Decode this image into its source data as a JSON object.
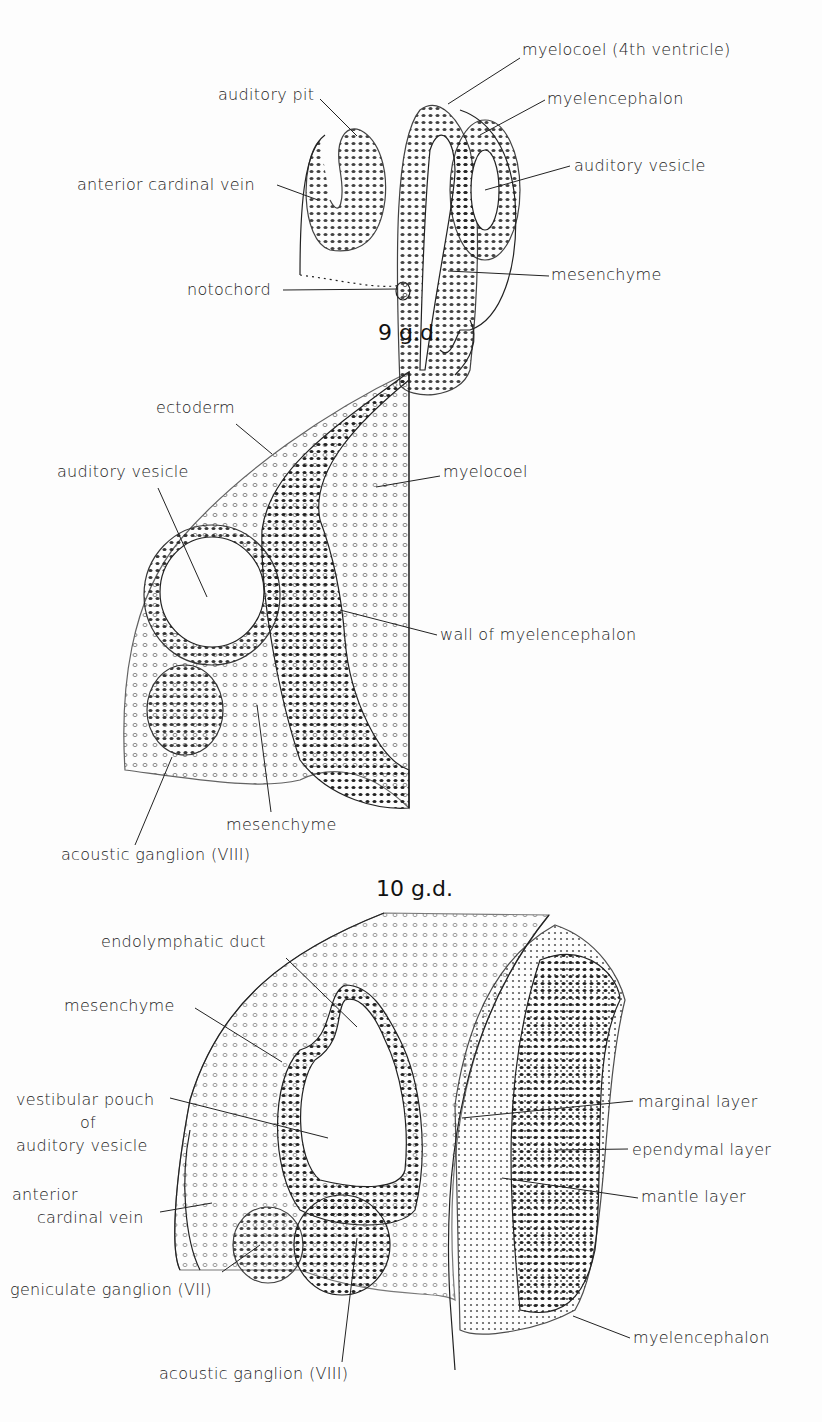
{
  "panels": [
    {
      "caption": "9 g.d.",
      "labels": {
        "myelocoel": "myelocoel (4th ventricle)",
        "auditory_pit": "auditory pit",
        "myelencephalon": "myelencephalon",
        "auditory_vesicle": "auditory vesicle",
        "anterior_cardinal_vein": "anterior cardinal vein",
        "mesenchyme": "mesenchyme",
        "notochord": "notochord"
      }
    },
    {
      "caption": "10 g.d.",
      "labels": {
        "ectoderm": "ectoderm",
        "auditory_vesicle": "auditory vesicle",
        "myelocoel": "myelocoel",
        "wall_of_myelencephalon": "wall of myelencephalon",
        "mesenchyme": "mesenchyme",
        "acoustic_ganglion": "acoustic ganglion (VIII)"
      }
    },
    {
      "caption": "",
      "labels": {
        "endolymphatic_duct": "endolymphatic duct",
        "mesenchyme": "mesenchyme",
        "vestibular_pouch_1": "vestibular pouch",
        "vestibular_pouch_2": "of",
        "vestibular_pouch_3": "auditory vesicle",
        "anterior_cardinal_vein_1": "anterior",
        "anterior_cardinal_vein_2": "cardinal vein",
        "geniculate_ganglion": "geniculate ganglion (VII)",
        "acoustic_ganglion": "acoustic ganglion (VIII)",
        "marginal_layer": "marginal layer",
        "ependymal_layer": "ependymal layer",
        "mantle_layer": "mantle layer",
        "myelencephalon": "myelencephalon"
      }
    }
  ]
}
